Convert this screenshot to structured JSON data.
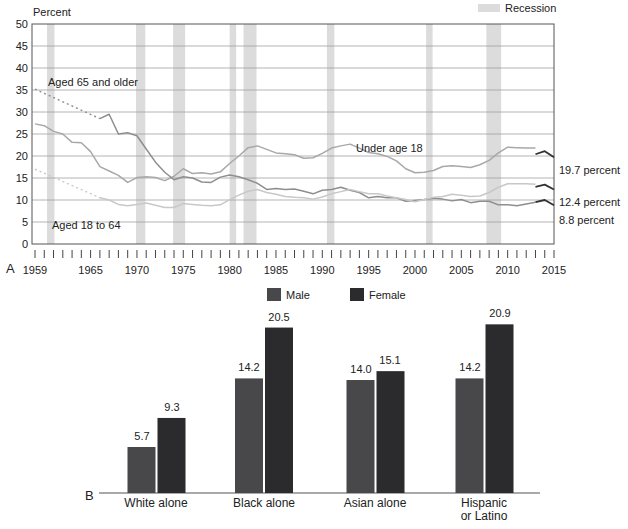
{
  "figure": {
    "panel_a_label": "A",
    "panel_b_label": "B",
    "background": "#ffffff",
    "text_color": "#222222"
  },
  "chart_data": [
    {
      "type": "line",
      "panel": "A",
      "ylabel": "Percent",
      "ylim": [
        0,
        50
      ],
      "ytick_step": 5,
      "xlim": [
        1959,
        2015
      ],
      "xticks_labeled": [
        1959,
        1965,
        1970,
        1975,
        1980,
        1985,
        1990,
        1995,
        2000,
        2005,
        2010,
        2015
      ],
      "grid": true,
      "legend": {
        "label": "Recession",
        "color": "#dcdcdc",
        "position": "top-right"
      },
      "recessions": [
        [
          1960.3,
          1961.1
        ],
        [
          1969.9,
          1970.9
        ],
        [
          1973.9,
          1975.2
        ],
        [
          1980.0,
          1980.7
        ],
        [
          1981.5,
          1982.9
        ],
        [
          1990.5,
          1991.3
        ],
        [
          2001.2,
          2001.9
        ],
        [
          2007.7,
          2009.3
        ]
      ],
      "series": [
        {
          "name": "Under age 18",
          "color": "#a8a8a8",
          "start_year": 1959,
          "values": [
            27.3,
            26.9,
            25.6,
            25,
            23.1,
            23,
            21,
            17.6,
            16.6,
            15.6,
            14,
            15.1,
            15.3,
            15.1,
            14.4,
            15.4,
            17.1,
            16,
            16.2,
            15.9,
            16.4,
            18.3,
            20,
            21.9,
            22.3,
            21.5,
            20.7,
            20.5,
            20.3,
            19.5,
            19.6,
            20.6,
            21.8,
            22.3,
            22.7,
            21.8,
            20.8,
            20.5,
            19.9,
            18.9,
            17.1,
            16.2,
            16.3,
            16.7,
            17.6,
            17.8,
            17.6,
            17.4,
            18,
            19,
            20.7,
            22,
            21.9,
            21.8,
            21.8
          ]
        },
        {
          "name": "Aged 65 and older",
          "color": "#8e8e8e",
          "dotted_from": [
            1959,
            35.2
          ],
          "start_year": 1966,
          "values": [
            28.5,
            29.5,
            25,
            25.3,
            24.6,
            21.6,
            18.6,
            16.3,
            14.6,
            15.3,
            15,
            14.1,
            14,
            15.2,
            15.7,
            15.3,
            14.6,
            13.8,
            12.4,
            12.6,
            12.4,
            12.5,
            12,
            11.4,
            12.2,
            12.4,
            12.9,
            12.2,
            11.7,
            10.5,
            10.8,
            10.5,
            10.5,
            9.7,
            9.9,
            10.1,
            10.4,
            10.2,
            9.8,
            10.1,
            9.4,
            9.7,
            9.7,
            8.9,
            8.9,
            8.7,
            9.1,
            9.5
          ]
        },
        {
          "name": "Aged 18 to 64",
          "color": "#c8c8c8",
          "dotted_from": [
            1959,
            17.0
          ],
          "start_year": 1966,
          "values": [
            10.5,
            10,
            9,
            8.7,
            9,
            9.3,
            8.8,
            8.3,
            8.3,
            9.2,
            9,
            8.8,
            8.7,
            8.9,
            10.1,
            11.1,
            12,
            12.4,
            11.7,
            11.3,
            10.8,
            10.6,
            10.5,
            10.2,
            10.7,
            11.4,
            11.9,
            12.4,
            11.9,
            11.4,
            11.4,
            10.9,
            10.5,
            10.1,
            9.6,
            10.1,
            10.6,
            10.8,
            11.3,
            11.1,
            10.8,
            10.9,
            11.7,
            12.9,
            13.7,
            13.7,
            13.7,
            13.6
          ]
        }
      ],
      "revised_series": [
        {
          "name": "Under age 18 revised",
          "color": "#323234",
          "start_year": 2013,
          "values": [
            20.4,
            21.1,
            19.7
          ]
        },
        {
          "name": "Aged 18 to 64 revised",
          "color": "#323234",
          "start_year": 2013,
          "values": [
            13.0,
            13.5,
            12.4
          ]
        },
        {
          "name": "Aged 65 and older revised",
          "color": "#323234",
          "start_year": 2013,
          "values": [
            9.5,
            10.0,
            8.8
          ]
        }
      ],
      "annotations": [
        {
          "text": "Aged 65 and older"
        },
        {
          "text": "Under age 18"
        },
        {
          "text": "Aged 18 to 64"
        }
      ],
      "end_labels": [
        {
          "text": "19.7 percent",
          "value": 19.7,
          "series": "Under age 18"
        },
        {
          "text": "12.4 percent",
          "value": 12.4,
          "series": "Aged 18 to 64"
        },
        {
          "text": "8.8 percent",
          "value": 8.8,
          "series": "Aged 65 and older"
        }
      ]
    },
    {
      "type": "bar",
      "panel": "B",
      "categories": [
        "White alone",
        "Black alone",
        "Asian alone",
        "Hispanic or Latino"
      ],
      "category_lines": [
        [
          "White alone"
        ],
        [
          "Black alone"
        ],
        [
          "Asian alone"
        ],
        [
          "Hispanic",
          "or Latino"
        ]
      ],
      "series": [
        {
          "name": "Male",
          "color": "#48484a",
          "values": [
            5.7,
            14.2,
            14.0,
            14.2
          ]
        },
        {
          "name": "Female",
          "color": "#2b2b2d",
          "values": [
            9.3,
            20.5,
            15.1,
            20.9
          ]
        }
      ],
      "value_labels": [
        [
          "5.7",
          "14.2",
          "14.0",
          "14.2"
        ],
        [
          "9.3",
          "20.5",
          "15.1",
          "20.9"
        ]
      ],
      "legend_position": "top"
    }
  ]
}
